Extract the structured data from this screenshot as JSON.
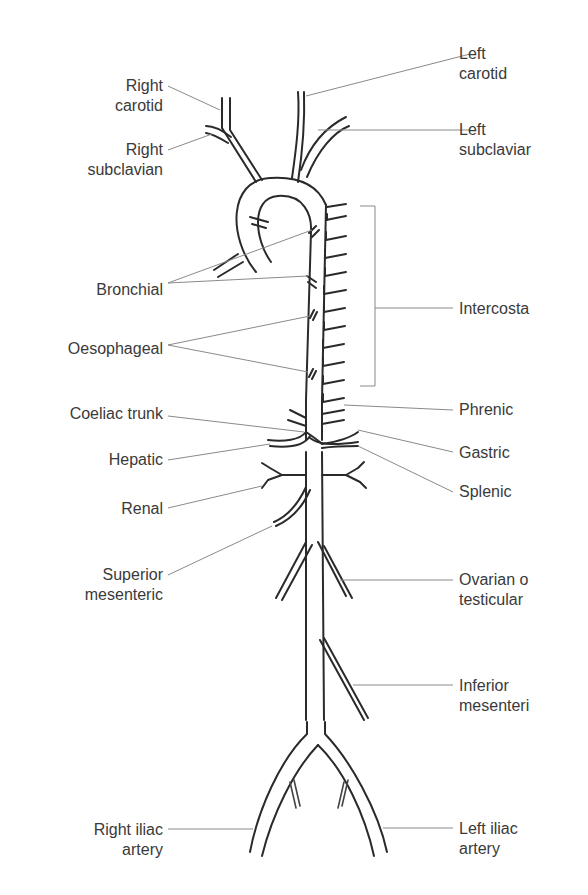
{
  "diagram": {
    "left_labels": [
      {
        "id": "right-carotid",
        "line1": "Right",
        "line2": "carotid"
      },
      {
        "id": "right-subclavian",
        "line1": "Right",
        "line2": "subclavian"
      },
      {
        "id": "bronchial",
        "line1": "Bronchial"
      },
      {
        "id": "oesophageal",
        "line1": "Oesophageal"
      },
      {
        "id": "coeliac-trunk",
        "line1": "Coeliac trunk"
      },
      {
        "id": "hepatic",
        "line1": "Hepatic"
      },
      {
        "id": "renal",
        "line1": "Renal"
      },
      {
        "id": "superior-mesenteric",
        "line1": "Superior",
        "line2": "mesenteric"
      },
      {
        "id": "right-iliac-artery",
        "line1": "Right iliac",
        "line2": "artery"
      }
    ],
    "right_labels": [
      {
        "id": "left-carotid",
        "line1": "Left",
        "line2": "carotid"
      },
      {
        "id": "left-subclavian",
        "line1": "Left",
        "line2": "subclaviar"
      },
      {
        "id": "intercostal",
        "line1": "Intercosta"
      },
      {
        "id": "phrenic",
        "line1": "Phrenic"
      },
      {
        "id": "gastric",
        "line1": "Gastric"
      },
      {
        "id": "splenic",
        "line1": "Splenic"
      },
      {
        "id": "ovarian-or-testicular",
        "line1": "Ovarian o",
        "line2": "testicular"
      },
      {
        "id": "inferior-mesenteric",
        "line1": "Inferior",
        "line2": "mesenteri"
      },
      {
        "id": "left-iliac-artery",
        "line1": "Left iliac",
        "line2": "artery"
      }
    ],
    "colors": {
      "vessel": "#2a2a2a",
      "leader": "#8a8a8a",
      "text": "#3a3a3a",
      "background": "#ffffff"
    }
  }
}
